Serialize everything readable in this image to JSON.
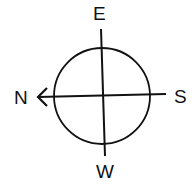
{
  "diagram": {
    "type": "compass",
    "labels": {
      "top": "E",
      "right": "S",
      "left": "N",
      "bottom": "W"
    },
    "arrow_direction": "N",
    "colors": {
      "stroke": "#111111",
      "background": "#ffffff"
    }
  }
}
